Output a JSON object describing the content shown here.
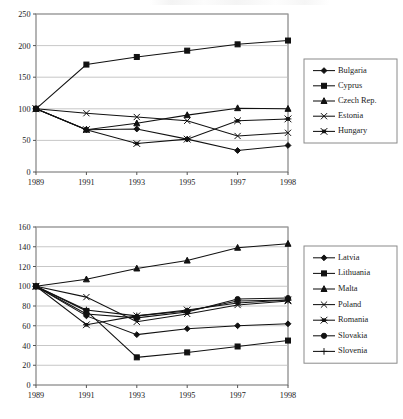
{
  "figure": {
    "background": "#ffffff",
    "line_color": "#111111",
    "grid_color": "#b9b9b9",
    "frame_color": "#6b6b6b"
  },
  "chart_data": [
    {
      "id": "chart-top",
      "type": "line",
      "title": "",
      "xlabel": "",
      "ylabel": "",
      "categories": [
        "1989",
        "1991",
        "1993",
        "1995",
        "1997",
        "1998"
      ],
      "ylim": [
        0,
        250
      ],
      "yticks": [
        0,
        50,
        100,
        150,
        200,
        250
      ],
      "grid": true,
      "legend_position": "right",
      "series": [
        {
          "name": "Bulgaria",
          "marker": "diamond",
          "values": [
            100,
            67,
            68,
            52,
            34,
            42
          ]
        },
        {
          "name": "Cyprus",
          "marker": "square",
          "values": [
            100,
            170,
            182,
            192,
            202,
            208
          ]
        },
        {
          "name": "Czech Rep.",
          "marker": "triangle",
          "values": [
            100,
            67,
            77,
            90,
            101,
            100
          ]
        },
        {
          "name": "Estonia",
          "marker": "cross-x",
          "values": [
            100,
            93,
            87,
            81,
            57,
            62
          ]
        },
        {
          "name": "Hungary",
          "marker": "star-x",
          "values": [
            100,
            67,
            45,
            52,
            81,
            84
          ]
        }
      ]
    },
    {
      "id": "chart-bottom",
      "type": "line",
      "title": "",
      "xlabel": "",
      "ylabel": "",
      "categories": [
        "1989",
        "1991",
        "1993",
        "1995",
        "1997",
        "1998"
      ],
      "ylim": [
        0,
        160
      ],
      "yticks": [
        0,
        20,
        40,
        60,
        80,
        100,
        120,
        140,
        160
      ],
      "grid": true,
      "legend_position": "right",
      "series": [
        {
          "name": "Latvia",
          "marker": "diamond",
          "values": [
            100,
            70,
            51,
            57,
            60,
            62
          ]
        },
        {
          "name": "Lithuania",
          "marker": "square",
          "values": [
            100,
            75,
            28,
            33,
            39,
            45
          ]
        },
        {
          "name": "Malta",
          "marker": "triangle",
          "values": [
            100,
            107,
            118,
            126,
            139,
            143
          ]
        },
        {
          "name": "Poland",
          "marker": "cross-x",
          "values": [
            100,
            89,
            64,
            72,
            81,
            85
          ]
        },
        {
          "name": "Romania",
          "marker": "star-x",
          "values": [
            100,
            61,
            70,
            76,
            83,
            86
          ]
        },
        {
          "name": "Slovakia",
          "marker": "circle",
          "values": [
            100,
            72,
            68,
            74,
            87,
            88
          ]
        },
        {
          "name": "Slovenia",
          "marker": "plus",
          "values": [
            100,
            76,
            70,
            75,
            85,
            86
          ]
        }
      ]
    }
  ]
}
